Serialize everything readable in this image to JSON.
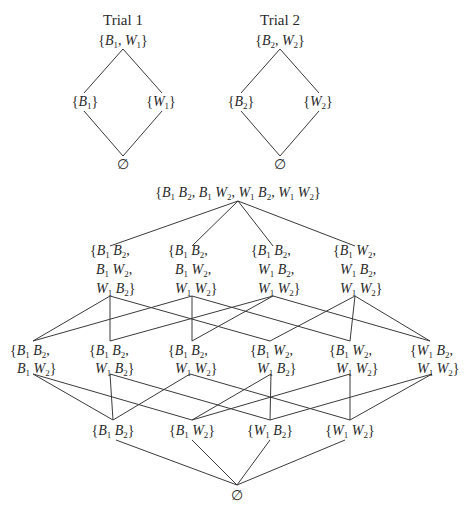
{
  "top_cutoff_text": "the other that trial one for the second trial.",
  "trials": [
    {
      "title": "Trial 1",
      "top": {
        "text": "{B1, W1}",
        "items": [
          [
            "B",
            "1"
          ],
          [
            "W",
            "1"
          ]
        ]
      },
      "left": {
        "text": "{B1}",
        "items": [
          [
            "B",
            "1"
          ]
        ]
      },
      "right": {
        "text": "{W1}",
        "items": [
          [
            "W",
            "1"
          ]
        ]
      },
      "bottom": {
        "text": "∅"
      }
    },
    {
      "title": "Trial 2",
      "top": {
        "text": "{B2, W2}",
        "items": [
          [
            "B",
            "2"
          ],
          [
            "W",
            "2"
          ]
        ]
      },
      "left": {
        "text": "{B2}",
        "items": [
          [
            "B",
            "2"
          ]
        ]
      },
      "right": {
        "text": "{W2}",
        "items": [
          [
            "W",
            "2"
          ]
        ]
      },
      "bottom": {
        "text": "∅"
      }
    }
  ],
  "lattice": {
    "top": {
      "text": "{B1B2, B1W2, W1B2, W1W2}"
    },
    "triples": [
      {
        "lines": [
          "{B1B2,",
          "B1W2,",
          "W1B2}"
        ]
      },
      {
        "lines": [
          "{B1B2,",
          "B1W2,",
          "W1W2}"
        ]
      },
      {
        "lines": [
          "{B1B2,",
          "W1B2,",
          "W1W2}"
        ]
      },
      {
        "lines": [
          "{B1W2,",
          "W1B2,",
          "W1W2}"
        ]
      }
    ],
    "pairs": [
      {
        "lines": [
          "{B1B2,",
          "B1W2}"
        ]
      },
      {
        "lines": [
          "{B1B2,",
          "W1B2}"
        ]
      },
      {
        "lines": [
          "{B1B2,",
          "W1W2}"
        ]
      },
      {
        "lines": [
          "{B1W2,",
          "W1B2}"
        ]
      },
      {
        "lines": [
          "{B1W2,",
          "W1W2}"
        ]
      },
      {
        "lines": [
          "{W1B2,",
          "W1W2}"
        ]
      }
    ],
    "singletons": [
      {
        "text": "{B1B2}"
      },
      {
        "text": "{B1W2}"
      },
      {
        "text": "{W1B2}"
      },
      {
        "text": "{W1W2}"
      }
    ],
    "bottom": {
      "text": "∅"
    }
  }
}
